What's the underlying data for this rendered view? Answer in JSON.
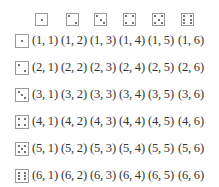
{
  "header_dice": [
    1,
    2,
    3,
    4,
    5,
    6
  ],
  "row_dice": [
    1,
    2,
    3,
    4,
    5,
    6
  ],
  "rows": [
    [
      "(1, 1)",
      "(1, 2)",
      "(1, 3)",
      "(1, 4)",
      "(1, 5)",
      "(1, 6)"
    ],
    [
      "(2, 1)",
      "(2, 2)",
      "(2, 3)",
      "(2, 4)",
      "(2, 5)",
      "(2, 6)"
    ],
    [
      "(3, 1)",
      "(3, 2)",
      "(3, 3)",
      "(3, 4)",
      "(3, 5)",
      "(3, 6)"
    ],
    [
      "(4, 1)",
      "(4, 2)",
      "(4, 3)",
      "(4, 4)",
      "(4, 5)",
      "(4, 6)"
    ],
    [
      "(5, 1)",
      "(5, 2)",
      "(5, 3)",
      "(5, 4)",
      "(5, 5)",
      "(5, 6)"
    ],
    [
      "(6, 1)",
      "(6, 2)",
      "(6, 3)",
      "(6, 4)",
      "(6, 5)",
      "(6, 6)"
    ]
  ]
}
